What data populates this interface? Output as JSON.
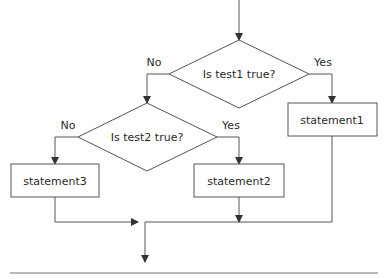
{
  "diagram": {
    "type": "flowchart",
    "nodes": {
      "decision1": {
        "label": "Is test1 true?"
      },
      "decision2": {
        "label": "Is test2 true?"
      },
      "statement1": {
        "label": "statement1"
      },
      "statement2": {
        "label": "statement2"
      },
      "statement3": {
        "label": "statement3"
      }
    },
    "edge_labels": {
      "d1_no": "No",
      "d1_yes": "Yes",
      "d2_no": "No",
      "d2_yes": "Yes"
    },
    "edges": [
      {
        "from": "start",
        "to": "decision1"
      },
      {
        "from": "decision1",
        "to": "statement1",
        "label": "Yes"
      },
      {
        "from": "decision1",
        "to": "decision2",
        "label": "No"
      },
      {
        "from": "decision2",
        "to": "statement2",
        "label": "Yes"
      },
      {
        "from": "decision2",
        "to": "statement3",
        "label": "No"
      },
      {
        "from": "statement1",
        "to": "end"
      },
      {
        "from": "statement2",
        "to": "end"
      },
      {
        "from": "statement3",
        "to": "end"
      }
    ],
    "colors": {
      "stroke": "#555555",
      "text": "#2a2a2a",
      "background": "#ffffff"
    }
  }
}
